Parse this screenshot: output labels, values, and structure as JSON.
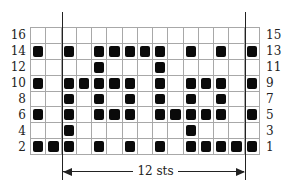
{
  "chart_data": {
    "type": "knitting-chart",
    "columns": 15,
    "rows_displayed": 8,
    "left_labels": [
      "16",
      "14",
      "12",
      "10",
      "8",
      "6",
      "4",
      "2"
    ],
    "right_labels": [
      "15",
      "13",
      "11",
      "9",
      "7",
      "5",
      "3",
      "1"
    ],
    "filled_cells_by_row_top_to_bottom": [
      [],
      [
        1,
        3,
        5,
        6,
        7,
        8,
        9,
        11,
        13,
        15
      ],
      [
        5,
        9
      ],
      [
        1,
        3,
        4,
        5,
        6,
        7,
        9,
        11,
        12,
        13,
        15
      ],
      [
        3,
        5,
        7,
        9,
        11,
        13
      ],
      [
        1,
        3,
        5,
        6,
        7,
        9,
        10,
        11,
        12,
        13,
        15
      ],
      [
        3,
        11
      ],
      [
        1,
        2,
        3,
        5,
        7,
        9,
        11,
        12,
        13,
        14,
        15
      ]
    ],
    "repeat": {
      "label": "12 sts",
      "from_column": 3,
      "to_column": 14
    },
    "colors": {
      "filled": "#0a0a0a",
      "grid": "#a8a8a8",
      "background": "#ffffff"
    }
  },
  "annotation": {
    "repeat_label": "12 sts"
  }
}
